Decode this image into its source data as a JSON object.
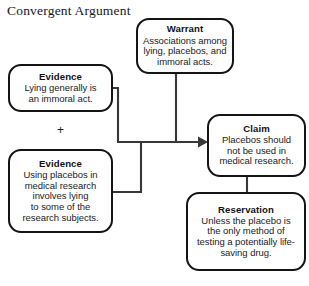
{
  "diagram": {
    "title": "Convergent Argument",
    "type": "argument-map",
    "stroke_color": "#141416",
    "text_color": "#1b1b1d",
    "background_color": "#ffffff",
    "operator": "+",
    "nodes": [
      {
        "id": "warrant",
        "title": "Warrant",
        "body": "Associations among\nlying, placebos, and\nimmoral acts."
      },
      {
        "id": "evidence-1",
        "title": "Evidence",
        "body": "Lying generally is\nan immoral act."
      },
      {
        "id": "evidence-2",
        "title": "Evidence",
        "body": "Using placebos in\nmedical research\ninvolves lying\nto some of the\nresearch subjects."
      },
      {
        "id": "claim",
        "title": "Claim",
        "body": "Placebos should\nnot be used in\nmedical research."
      },
      {
        "id": "reservation",
        "title": "Reservation",
        "body": "Unless the placebo is\nthe only method of\ntesting a potentially life-\nsaving drug."
      }
    ],
    "connectors": [
      {
        "id": "evidence-1-to-junction",
        "from": "evidence-1",
        "to": "claim",
        "arrow": false
      },
      {
        "id": "evidence-2-to-junction",
        "from": "evidence-2",
        "to": "claim",
        "arrow": false
      },
      {
        "id": "junction-to-claim",
        "from": "evidence-junction",
        "to": "claim",
        "arrow": true
      },
      {
        "id": "warrant-to-junction",
        "from": "warrant",
        "to": "evidence-junction",
        "arrow": false
      },
      {
        "id": "claim-to-reservation",
        "from": "claim",
        "to": "reservation",
        "arrow": false
      }
    ]
  }
}
